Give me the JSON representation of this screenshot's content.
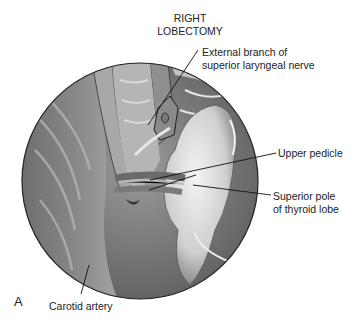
{
  "figure": {
    "title_line1": "RIGHT",
    "title_line2": "LOBECTOMY",
    "panel_letter": "A",
    "labels": {
      "ext_branch_line1": "External branch of",
      "ext_branch_line2": "superior laryngeal nerve",
      "upper_pedicle": "Upper pedicle",
      "superior_pole_line1": "Superior pole",
      "superior_pole_line2": "of thyroid lobe",
      "carotid": "Carotid artery"
    }
  }
}
